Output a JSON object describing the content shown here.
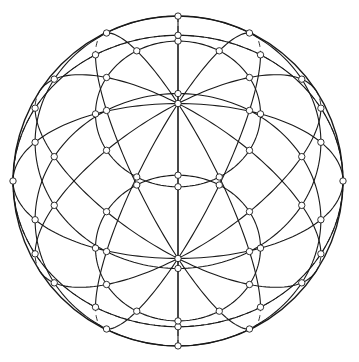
{
  "diagram": {
    "title": "Wireframe sphere with latitude and meridian grid",
    "canvas": {
      "width": 359,
      "height": 362,
      "background": "#ffffff"
    },
    "sphere": {
      "cx": 178,
      "cy": 181,
      "r": 165
    },
    "stroke": {
      "color": "#1a1a1a",
      "front_width": 1.1,
      "back_width": 0.9,
      "dash": "6 4"
    },
    "node": {
      "radius": 3.2,
      "fill": "#ffffff",
      "stroke": "#1a1a1a",
      "stroke_width": 0.9
    },
    "views": [
      {
        "name": "north-view",
        "tilt_deg": 62,
        "flip": 1
      },
      {
        "name": "south-view",
        "tilt_deg": 62,
        "flip": -1
      }
    ],
    "latitudes_deg": [
      60,
      30,
      0
    ],
    "meridians_deg": [
      0,
      30,
      60,
      90,
      120,
      150,
      180,
      210,
      240,
      270,
      300,
      330
    ],
    "rotation_deg": 0
  }
}
